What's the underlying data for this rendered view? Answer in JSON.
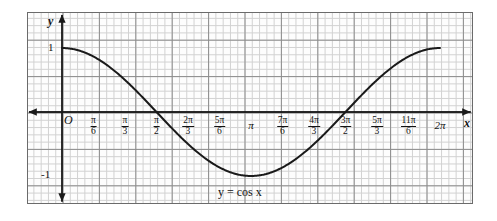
{
  "figure": {
    "caption_equation": "y = cos x",
    "axis_labels": {
      "x": "x",
      "y": "y",
      "origin": "O"
    },
    "y_ticks": [
      {
        "label": "1",
        "value": 1
      },
      {
        "label": "-1",
        "value": -1
      }
    ],
    "colors": {
      "curve": "#1a1a1a",
      "axis": "#1a1a1a",
      "grid_minor": "#d2d2d2",
      "grid_major": "#8d8d8d",
      "frame": "#6b6b6b",
      "background": "#ffffff"
    }
  },
  "chart_data": {
    "type": "line",
    "title": "",
    "subtitle": "",
    "annotations": [
      {
        "text": "y = cos x",
        "x": 3.141592653589793,
        "y": -1.35
      }
    ],
    "xlabel": "x",
    "ylabel": "y",
    "xlim": [
      -0.18,
      6.72
    ],
    "ylim": [
      -1.55,
      1.55
    ],
    "grid": true,
    "legend": null,
    "xticks": [
      {
        "value": 0,
        "label": "O",
        "num": "",
        "den": ""
      },
      {
        "value": 0.5235987755982988,
        "label": "π/6",
        "num": "π",
        "den": "6"
      },
      {
        "value": 1.0471975511965976,
        "label": "π/3",
        "num": "π",
        "den": "3"
      },
      {
        "value": 1.5707963267948966,
        "label": "π/2",
        "num": "π",
        "den": "2"
      },
      {
        "value": 2.0943951023931953,
        "label": "2π/3",
        "num": "2π",
        "den": "3"
      },
      {
        "value": 2.617993877991494,
        "label": "5π/6",
        "num": "5π",
        "den": "6"
      },
      {
        "value": 3.141592653589793,
        "label": "π",
        "num": "",
        "den": ""
      },
      {
        "value": 3.6651914291880923,
        "label": "7π/6",
        "num": "7π",
        "den": "6"
      },
      {
        "value": 4.1887902047863905,
        "label": "4π/3",
        "num": "4π",
        "den": "3"
      },
      {
        "value": 4.71238898038469,
        "label": "3π/2",
        "num": "3π",
        "den": "2"
      },
      {
        "value": 5.235987755982988,
        "label": "5π/3",
        "num": "5π",
        "den": "3"
      },
      {
        "value": 5.759586531581287,
        "label": "11π/6",
        "num": "11π",
        "den": "6"
      },
      {
        "value": 6.283185307179586,
        "label": "2π",
        "num": "",
        "den": ""
      }
    ],
    "yticks": [
      {
        "value": 1,
        "label": "1"
      },
      {
        "value": -1,
        "label": "-1"
      }
    ],
    "series": [
      {
        "name": "y = cos x",
        "function": "cos",
        "x": [
          0,
          0.2617993877991494,
          0.5235987755982988,
          0.7853981633974483,
          1.0471975511965976,
          1.3089969389957472,
          1.5707963267948966,
          1.832595714594046,
          2.0943951023931953,
          2.356194490192345,
          2.617993877991494,
          2.8797932657906435,
          3.141592653589793,
          3.4033920413889422,
          3.6651914291880923,
          3.9269908169872414,
          4.1887902047863905,
          4.4505895925855405,
          4.71238898038469,
          4.974188368183839,
          5.235987755982988,
          5.497787143782138,
          5.759586531581287,
          6.021385919380436,
          6.283185307179586
        ],
        "y": [
          1,
          0.9659,
          0.866,
          0.7071,
          0.5,
          0.2588,
          0,
          -0.2588,
          -0.5,
          -0.7071,
          -0.866,
          -0.9659,
          -1,
          -0.9659,
          -0.866,
          -0.7071,
          -0.5,
          -0.2588,
          0,
          0.2588,
          0.5,
          0.7071,
          0.866,
          0.9659,
          1
        ]
      }
    ]
  }
}
